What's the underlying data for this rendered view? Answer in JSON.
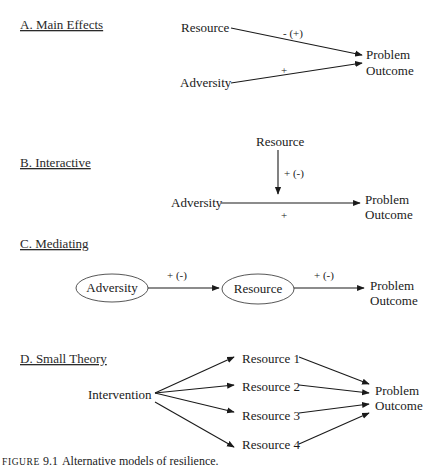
{
  "sections": {
    "a": {
      "title": "A. Main Effects",
      "nodes": {
        "resource": "Resource",
        "adversity": "Adversity",
        "outcome_1": "Problem",
        "outcome_2": "Outcome"
      },
      "edges": [
        {
          "from": "Resource",
          "to": "Problem Outcome",
          "label": "- (+)"
        },
        {
          "from": "Adversity",
          "to": "Problem Outcome",
          "label": "+"
        }
      ]
    },
    "b": {
      "title": "B. Interactive",
      "nodes": {
        "resource": "Resource",
        "adversity": "Adversity",
        "outcome_1": "Problem",
        "outcome_2": "Outcome"
      },
      "edges": [
        {
          "from": "Resource",
          "to": "Adversity→Outcome path",
          "label": "+ (-)"
        },
        {
          "from": "Adversity",
          "to": "Problem Outcome",
          "label": "+"
        }
      ]
    },
    "c": {
      "title": "C. Mediating",
      "nodes": {
        "adversity": "Adversity",
        "resource": "Resource",
        "outcome_1": "Problem",
        "outcome_2": "Outcome"
      },
      "edges": [
        {
          "from": "Adversity",
          "to": "Resource",
          "label": "+ (-)"
        },
        {
          "from": "Resource",
          "to": "Problem Outcome",
          "label": "+ (-)"
        }
      ]
    },
    "d": {
      "title": "D. Small Theory",
      "nodes": {
        "intervention": "Intervention",
        "resources": [
          "Resource 1",
          "Resource 2",
          "Resource 3",
          "Resource 4"
        ],
        "outcome_1": "Problem",
        "outcome_2": "Outcome"
      }
    }
  },
  "caption": {
    "prefix": "FIGURE",
    "number": "9.1",
    "text": "Alternative models of resilience."
  }
}
